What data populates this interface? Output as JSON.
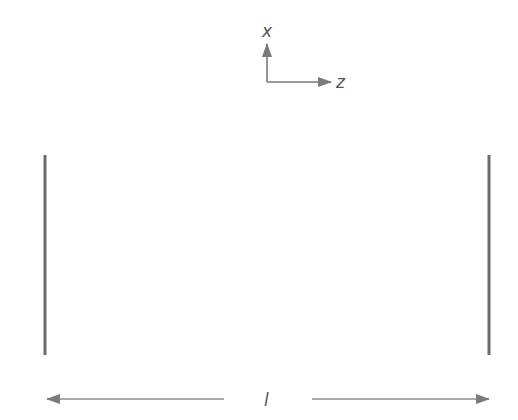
{
  "diagram": {
    "axes": {
      "vertical_label": "x",
      "horizontal_label": "z"
    },
    "plates": [
      {
        "name": "left-plate"
      },
      {
        "name": "right-plate"
      }
    ],
    "separation_label": "l",
    "colors": {
      "plate": "#6b6b6b",
      "arrow": "#7a7a7a",
      "text": "#555555"
    }
  }
}
